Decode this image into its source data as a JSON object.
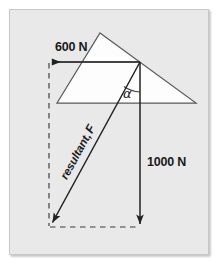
{
  "figure": {
    "type": "physics-vector-diagram",
    "canvas": {
      "width": 224,
      "height": 268
    },
    "colors": {
      "page_background": "#ffffff",
      "panel_background": "#e9e9e9",
      "panel_border": "#c9c9c9",
      "panel_shadow": "#bcbcbc",
      "shape_fill": "#fdfdfd",
      "shape_stroke": "#555555",
      "vector_stroke": "#2b2b2b",
      "dashed_stroke": "#3a3a3a",
      "label_color": "#1a1a1a"
    },
    "panel": {
      "x": 9,
      "y": 9,
      "width": 200,
      "height": 246
    },
    "roof": {
      "name": "roof-triangle",
      "apex": {
        "x": 100,
        "y": 33
      },
      "left_vertex": {
        "x": 57,
        "y": 103
      },
      "right_vertex": {
        "x": 196,
        "y": 103
      },
      "ridge_line_from": {
        "x": 57,
        "y": 62
      },
      "ridge_line_to": {
        "x": 140,
        "y": 62
      }
    },
    "origin": {
      "x": 140,
      "y": 62
    },
    "vectors": [
      {
        "id": "horizontal-force",
        "label": "600 N",
        "magnitude": 600,
        "unit": "N",
        "direction": "left",
        "from": {
          "x": 140,
          "y": 62
        },
        "to": {
          "x": 50,
          "y": 62
        },
        "style": "solid",
        "label_position": {
          "x": 55,
          "y": 50
        }
      },
      {
        "id": "vertical-force",
        "label": "1000 N",
        "magnitude": 1000,
        "unit": "N",
        "direction": "down",
        "from": {
          "x": 140,
          "y": 62
        },
        "to": {
          "x": 140,
          "y": 227
        },
        "style": "solid",
        "label_position": {
          "x": 147,
          "y": 162
        }
      },
      {
        "id": "resultant-force",
        "label_prefix": "resultant,",
        "label_symbol": "F",
        "direction": "down-left",
        "from": {
          "x": 140,
          "y": 62
        },
        "to": {
          "x": 50,
          "y": 227
        },
        "style": "solid",
        "label_rotation_deg": 61,
        "label_position": {
          "x": 83,
          "y": 155
        }
      }
    ],
    "construction_lines": [
      {
        "id": "left-dashed-edge",
        "from": {
          "x": 49,
          "y": 62
        },
        "to": {
          "x": 49,
          "y": 227
        },
        "style": "dashed"
      },
      {
        "id": "bottom-dashed-edge",
        "from": {
          "x": 49,
          "y": 227
        },
        "to": {
          "x": 140,
          "y": 227
        },
        "style": "dashed"
      }
    ],
    "angle": {
      "id": "alpha-angle",
      "symbol": "α",
      "vertex": {
        "x": 140,
        "y": 62
      },
      "between": [
        "resultant-force",
        "vertical-force"
      ],
      "arc_radius": 30,
      "label_position": {
        "x": 126,
        "y": 96
      }
    }
  }
}
